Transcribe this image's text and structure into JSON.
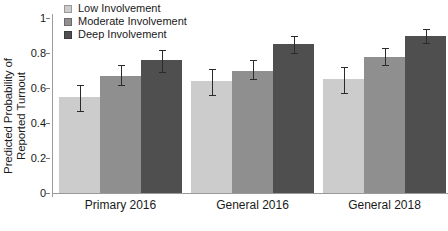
{
  "chart_data": {
    "type": "bar",
    "title": "",
    "xlabel": "",
    "ylabel": "Predicted Probability of\nReported Turnout",
    "ylabel_line1": "Predicted Probability of",
    "ylabel_line2": "Reported Turnout",
    "ylim": [
      0,
      1
    ],
    "yticks": [
      0,
      0.2,
      0.4,
      0.6,
      0.8,
      1
    ],
    "ytick_labels": [
      "0",
      "0.2",
      "0.4",
      "0.6",
      "0.8",
      "1"
    ],
    "grid": false,
    "legend_position": "top-left",
    "categories": [
      "Primary 2016",
      "General 2016",
      "General 2018"
    ],
    "series": [
      {
        "name": "Low Involvement",
        "color": "#cccccc",
        "values": [
          0.55,
          0.64,
          0.65
        ],
        "err_low": [
          0.47,
          0.56,
          0.57
        ],
        "err_high": [
          0.62,
          0.71,
          0.72
        ]
      },
      {
        "name": "Moderate Involvement",
        "color": "#8f8f8f",
        "values": [
          0.67,
          0.7,
          0.78
        ],
        "err_low": [
          0.62,
          0.65,
          0.73
        ],
        "err_high": [
          0.73,
          0.76,
          0.83
        ]
      },
      {
        "name": "Deep Involvement",
        "color": "#4f4f4f",
        "values": [
          0.76,
          0.85,
          0.9
        ],
        "err_low": [
          0.69,
          0.8,
          0.86
        ],
        "err_high": [
          0.82,
          0.9,
          0.94
        ]
      }
    ]
  },
  "legend": {
    "items": [
      {
        "label": "Low Involvement",
        "color": "#cccccc"
      },
      {
        "label": "Moderate Involvement",
        "color": "#8f8f8f"
      },
      {
        "label": "Deep Involvement",
        "color": "#4f4f4f"
      }
    ]
  },
  "axes": {
    "y_title_line1": "Predicted Probability of",
    "y_title_line2": "Reported Turnout",
    "y_tick_labels": [
      "1",
      "0.8",
      "0.6",
      "0.4",
      "0.2",
      "0"
    ],
    "x_group_labels": [
      "Primary 2016",
      "General 2016",
      "General 2018"
    ]
  },
  "colors": {
    "low": "#cccccc",
    "moderate": "#8f8f8f",
    "deep": "#4f4f4f",
    "axis": "#9a9a9a",
    "error": "#2b2b2b",
    "background": "#ffffff"
  }
}
